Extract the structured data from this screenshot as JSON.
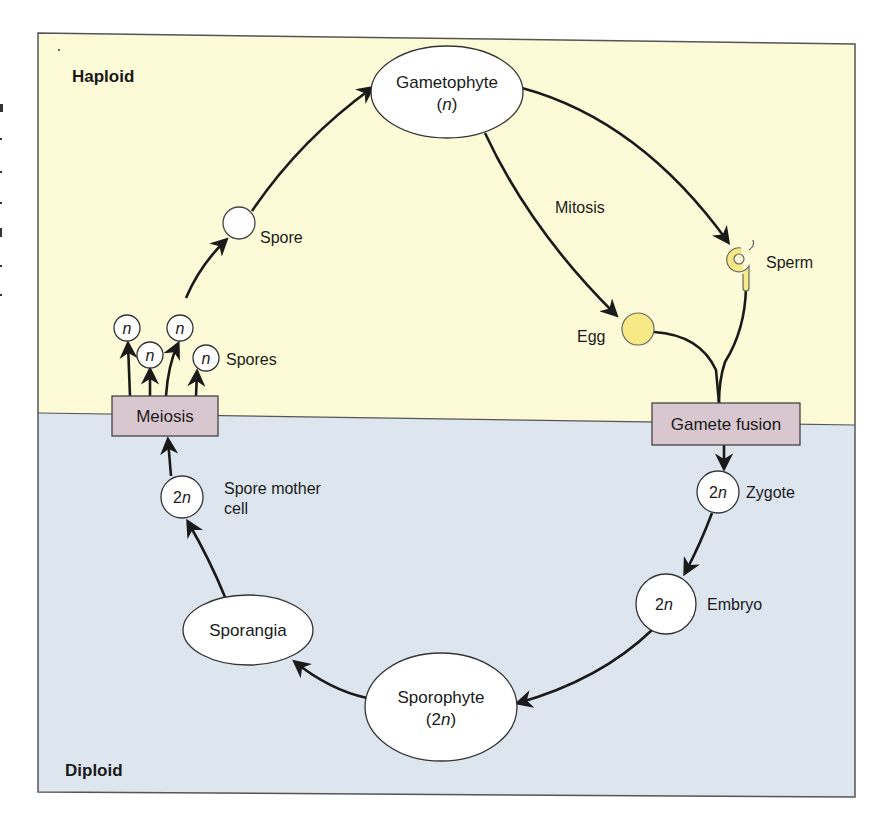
{
  "diagram": {
    "colors": {
      "haploid_bg": "#fdfbd7",
      "diploid_bg": "#dde6ef",
      "process_box": "#d9c7cf",
      "gamete_yellow": "#f7ea86",
      "node_fill": "#ffffff",
      "stroke": "#1a1a1a"
    },
    "regions": {
      "haploid": "Haploid",
      "diploid": "Diploid"
    },
    "nodes": {
      "gametophyte": {
        "label": "Gametophyte",
        "ploidy": "(n)",
        "ploidy_pre": "(",
        "ploidy_var": "n",
        "ploidy_post": ")"
      },
      "spore": {
        "label": "Spore"
      },
      "spores": {
        "label": "Spores",
        "ploidy": "n"
      },
      "meiosis": {
        "label": "Meiosis"
      },
      "spore_mother_cell": {
        "label_line1": "Spore mother",
        "label_line2": "cell",
        "ploidy_num": "2",
        "ploidy_var": "n"
      },
      "sporangia": {
        "label": "Sporangia"
      },
      "sporophyte": {
        "label": "Sporophyte",
        "ploidy_pre": "(2",
        "ploidy_var": "n",
        "ploidy_post": ")"
      },
      "embryo": {
        "label": "Embryo",
        "ploidy_num": "2",
        "ploidy_var": "n"
      },
      "zygote": {
        "label": "Zygote",
        "ploidy_num": "2",
        "ploidy_var": "n"
      },
      "gamete_fusion": {
        "label": "Gamete fusion"
      },
      "egg": {
        "label": "Egg"
      },
      "sperm": {
        "label": "Sperm"
      },
      "mitosis": {
        "label": "Mitosis"
      }
    },
    "edges": [
      {
        "from": "Gametophyte",
        "to": "Egg",
        "via": "Mitosis"
      },
      {
        "from": "Gametophyte",
        "to": "Sperm",
        "via": "Mitosis"
      },
      {
        "from": "Egg",
        "to": "Gamete fusion"
      },
      {
        "from": "Sperm",
        "to": "Gamete fusion"
      },
      {
        "from": "Gamete fusion",
        "to": "Zygote"
      },
      {
        "from": "Zygote",
        "to": "Embryo"
      },
      {
        "from": "Embryo",
        "to": "Sporophyte"
      },
      {
        "from": "Sporophyte",
        "to": "Sporangia"
      },
      {
        "from": "Sporangia",
        "to": "Spore mother cell"
      },
      {
        "from": "Spore mother cell",
        "to": "Meiosis"
      },
      {
        "from": "Meiosis",
        "to": "Spores"
      },
      {
        "from": "Spores",
        "to": "Spore"
      },
      {
        "from": "Spore",
        "to": "Gametophyte"
      }
    ]
  }
}
